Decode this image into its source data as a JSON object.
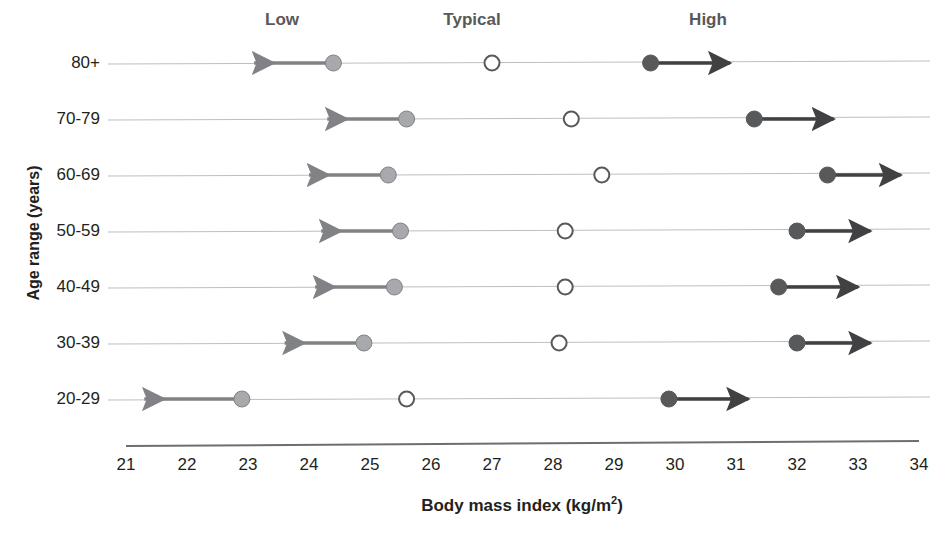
{
  "chart_data": {
    "type": "scatter",
    "title": "",
    "xlabel": "Body mass index (kg/m2)",
    "ylabel": "Age range (years)",
    "xlim": [
      21,
      34
    ],
    "xticks": [
      21,
      22,
      23,
      24,
      25,
      26,
      27,
      28,
      29,
      30,
      31,
      32,
      33,
      34
    ],
    "grid": false,
    "legend_position": "top",
    "column_headers": [
      "Low",
      "Typical",
      "High"
    ],
    "categories": [
      "80+",
      "70-79",
      "60-69",
      "50-59",
      "40-49",
      "30-39",
      "20-29"
    ],
    "series": [
      {
        "name": "Low",
        "marker": "filled-grey-circle",
        "color": "#a7a9ac",
        "arrow": "left",
        "values": [
          24.4,
          25.6,
          25.3,
          25.5,
          25.4,
          24.9,
          22.9
        ],
        "arrow_tips": [
          23.1,
          24.3,
          24.0,
          24.2,
          24.1,
          23.6,
          21.3
        ]
      },
      {
        "name": "Typical",
        "marker": "open-circle",
        "color": "#ffffff",
        "arrow": "none",
        "values": [
          27.0,
          28.3,
          28.8,
          28.2,
          28.2,
          28.1,
          25.6
        ],
        "arrow_tips": [
          null,
          null,
          null,
          null,
          null,
          null,
          null
        ]
      },
      {
        "name": "High",
        "marker": "filled-dark-circle",
        "color": "#58595b",
        "arrow": "right",
        "values": [
          29.6,
          31.3,
          32.5,
          32.0,
          31.7,
          32.0,
          29.9
        ],
        "arrow_tips": [
          30.9,
          32.6,
          33.7,
          33.2,
          33.0,
          33.2,
          31.2
        ]
      }
    ]
  },
  "axis": {
    "x_title_main": "Body mass index (kg/m",
    "x_title_sup": "2",
    "x_title_end": ")",
    "y_title": "Age range (years)"
  },
  "colors": {
    "low_marker": "#a7a9ac",
    "typical_marker": "#ffffff",
    "high_marker": "#58595b",
    "low_arrow": "#808285",
    "high_arrow": "#414042",
    "row_line": "#bcbec0",
    "axis_line": "#6d6e71",
    "header_text": "#58595b",
    "text": "#231f20"
  }
}
